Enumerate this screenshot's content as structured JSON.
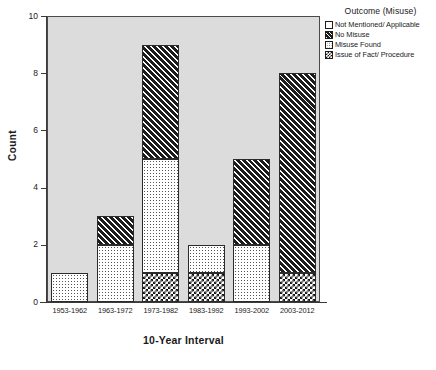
{
  "chart_data": {
    "type": "bar",
    "subtype": "stacked",
    "title": "",
    "xlabel": "10-Year Interval",
    "ylabel": "Count",
    "categories": [
      "1953-1962",
      "1963-1972",
      "1973-1982",
      "1983-1992",
      "1993-2002",
      "2003-2012"
    ],
    "ylim": [
      0,
      10
    ],
    "yticks": [
      0,
      2,
      4,
      6,
      8,
      10
    ],
    "ytick_labels": [
      "0",
      "2",
      "4",
      "6",
      "8",
      "10"
    ],
    "grid": false,
    "legend_position": "top-right",
    "legend_title": "Outcome (Misuse)",
    "series": [
      {
        "name": "Not Mentioned/ Applicable",
        "pattern": "blank",
        "values": [
          0,
          0,
          0,
          0,
          0,
          0
        ]
      },
      {
        "name": "No Misuse",
        "pattern": "hatch",
        "values": [
          0,
          1,
          4,
          0,
          3,
          7
        ]
      },
      {
        "name": "Misuse Found",
        "pattern": "dots",
        "values": [
          1,
          2,
          4,
          1,
          2,
          0
        ]
      },
      {
        "name": "Issue of Fact/ Procedure",
        "pattern": "check",
        "values": [
          0,
          0,
          1,
          1,
          0,
          1
        ]
      }
    ],
    "stack_order_bottom_to_top": [
      "Issue of Fact/ Procedure",
      "Misuse Found",
      "No Misuse",
      "Not Mentioned/ Applicable"
    ],
    "totals": [
      1,
      3,
      9,
      2,
      5,
      8
    ],
    "plot_background": "#dcdcdc",
    "axis_color": "#3a3a3a"
  },
  "axes": {
    "y_title": "Count",
    "x_title": "10-Year Interval"
  },
  "legend": {
    "title": "Outcome (Misuse)",
    "items": [
      {
        "label": "Not Mentioned/ Applicable",
        "pattern": "blank"
      },
      {
        "label": "No Misuse",
        "pattern": "hatch"
      },
      {
        "label": "Misuse Found",
        "pattern": "dots"
      },
      {
        "label": "Issue of Fact/ Procedure",
        "pattern": "check"
      }
    ]
  },
  "caption": ""
}
